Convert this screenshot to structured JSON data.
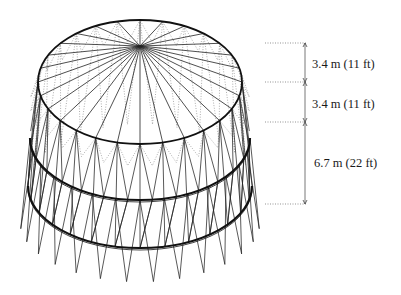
{
  "figure": {
    "type": "wireframe-tower-structure",
    "colors": {
      "stroke": "#222222",
      "hidden_stroke": "#777777",
      "dimension": "#555555",
      "background": "#ffffff"
    }
  },
  "geometry": {
    "apex": [
      140,
      46
    ],
    "top_ring": {
      "cx": 140,
      "cy": 82,
      "rx": 102,
      "ry": 62
    },
    "mid_ring": {
      "cx": 140,
      "cy": 138,
      "rx": 110,
      "ry": 62
    },
    "low_ring": {
      "cx": 140,
      "cy": 186,
      "rx": 112,
      "ry": 62
    },
    "base_ring": {
      "cx": 140,
      "cy": 220,
      "rx": 120,
      "ry": 62
    },
    "segments": 28
  },
  "dimensions": [
    {
      "label": "3.4 m (11 ft)",
      "from_y": 43,
      "to_y": 82
    },
    {
      "label": "3.4 m (11 ft)",
      "from_y": 82,
      "to_y": 122
    },
    {
      "label": "6.7 m (22 ft)",
      "from_y": 122,
      "to_y": 204
    }
  ],
  "dimension_line_x": 305
}
